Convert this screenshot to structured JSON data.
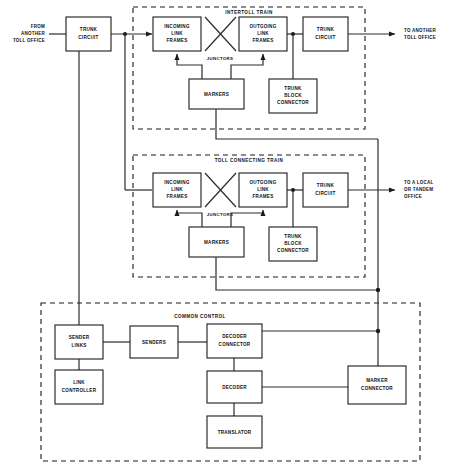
{
  "diagram": {
    "groups": [
      {
        "id": "intertoll",
        "label": "INTERTOLL TRAIN"
      },
      {
        "id": "toll_connecting",
        "label": "TOLL CONNECTING TRAIN"
      },
      {
        "id": "common_control",
        "label": "COMMON CONTROL"
      }
    ],
    "io_labels": {
      "input_left": [
        "FROM",
        "ANOTHER",
        "TOLL OFFICE"
      ],
      "output_top": [
        "TO ANOTHER",
        "TOLL OFFICE"
      ],
      "output_mid": [
        "TO A LOCAL",
        "OR TANDEM",
        "OFFICE"
      ]
    },
    "junctor_label": "JUNCTORS",
    "blocks": {
      "trunk_circuit_in": [
        "TRUNK",
        "CIRCUIT"
      ],
      "it_incoming_link": [
        "INCOMING",
        "LINK",
        "FRAMES"
      ],
      "it_outgoing_link": [
        "OUTGOING",
        "LINK",
        "FRAMES"
      ],
      "it_trunk_circuit_out": [
        "TRUNK",
        "CIRCUIT"
      ],
      "it_markers": [
        "MARKERS"
      ],
      "it_trunk_block": [
        "TRUNK",
        "BLOCK",
        "CONNECTOR"
      ],
      "tc_incoming_link": [
        "INCOMING",
        "LINK",
        "FRAMES"
      ],
      "tc_outgoing_link": [
        "OUTGOING",
        "LINK",
        "FRAMES"
      ],
      "tc_trunk_circuit_out": [
        "TRUNK",
        "CIRCUIT"
      ],
      "tc_markers": [
        "MARKERS"
      ],
      "tc_trunk_block": [
        "TRUNK",
        "BLOCK",
        "CONNECTOR"
      ],
      "sender_links": [
        "SENDER",
        "LINKS"
      ],
      "link_controller": [
        "LINK",
        "CONTROLLER"
      ],
      "senders": [
        "SENDERS"
      ],
      "decoder_connector": [
        "DECODER",
        "CONNECTOR"
      ],
      "decoder": [
        "DECODER"
      ],
      "translator": [
        "TRANSLATOR"
      ],
      "marker_connector": [
        "MARKER",
        "CONNECTOR"
      ]
    },
    "colors": {
      "line": "#2b2b2b",
      "box_stroke": "#1a1a1a",
      "box_fill": "#ffffff",
      "text": "#111111",
      "background": "#ffffff"
    }
  }
}
